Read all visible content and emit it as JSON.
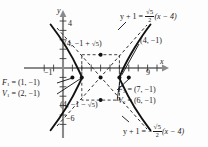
{
  "figure": {
    "type": "hyperbola-graph",
    "axes": {
      "x_axis_label": "x",
      "y_axis_label": "y",
      "x_ticks_labeled": [
        {
          "value": -1,
          "text": "−1"
        },
        {
          "value": 9,
          "text": "9"
        }
      ],
      "y_ticks_labeled": [
        {
          "value": 4,
          "text": "4"
        },
        {
          "value": -6,
          "text": "−6"
        }
      ],
      "x_range": [
        -2,
        11
      ],
      "y_range": [
        -7,
        5
      ],
      "origin_px": [
        63,
        68
      ],
      "unit_px": 9.4
    },
    "curve": {
      "center": [
        4,
        -1
      ],
      "a": 2,
      "b": 2.2360679,
      "vertices": [
        [
          2,
          -1
        ],
        [
          6,
          -1
        ]
      ],
      "foci": [
        [
          1,
          -1
        ],
        [
          7,
          -1
        ]
      ],
      "covertex_points": [
        [
          4,
          1.2360679
        ],
        [
          4,
          -3.2360679
        ]
      ]
    },
    "points": [
      {
        "name": "focus-1",
        "label_prefix": "F",
        "label_sub": "1",
        "label_eq": " = (1, −1)"
      },
      {
        "name": "vertex-1",
        "label_prefix": "V",
        "label_sub": "1",
        "label_eq": " = (2, −1)"
      },
      {
        "name": "focus-2",
        "label_prefix": "F",
        "label_sub": "2",
        "label_eq": " = (7, −1)"
      },
      {
        "name": "vertex-2",
        "label_prefix": "V",
        "label_sub": "2",
        "label_eq": " = (6, −1)"
      }
    ],
    "labels": {
      "point_top": "(4, −1 + √5)",
      "point_top_plain": "(4, −1 + ",
      "point_top_rad": "5",
      "point_bottom_plain": "(4, −1 − ",
      "point_bottom_rad": "5",
      "center_point": "(4, −1)",
      "tick_y_4": "4",
      "tick_y_neg6": "−6",
      "tick_x_neg1": "−1",
      "tick_x_9": "9",
      "axis_x": "x",
      "axis_y": "y"
    },
    "equations": {
      "asymptote_positive_lhs": "y + 1 = ",
      "asymptote_positive_num": "√5",
      "asymptote_positive_den": "2",
      "asymptote_positive_rhs": "(x − 4)",
      "asymptote_negative_lhs": "y + 1 = −",
      "asymptote_negative_num": "√5",
      "asymptote_negative_den": "2",
      "asymptote_negative_rhs": "(x − 4)"
    },
    "colors": {
      "curve": "#111111",
      "asymptote": "#333333",
      "axis": "#777777",
      "text": "#1a1a1a"
    }
  }
}
